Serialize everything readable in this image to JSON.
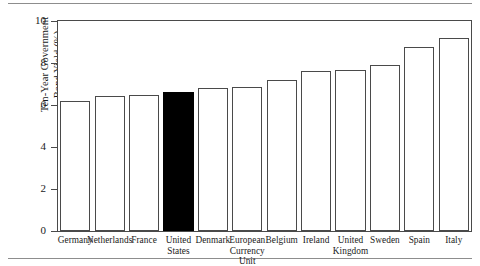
{
  "figure": {
    "rules": [
      "top-rule",
      "bottom-rule"
    ]
  },
  "chart_data": {
    "type": "bar",
    "title": "",
    "xlabel": "",
    "ylabel": "Ten-Year Government Bond Yield (%)",
    "ylabel_lines": [
      "Ten-Year Government",
      "Bond Yield (%)"
    ],
    "ylim": [
      0,
      10
    ],
    "yticks": [
      0,
      2,
      4,
      6,
      8,
      10
    ],
    "ytick_labels": [
      "0",
      "2",
      "4",
      "6",
      "8",
      "10"
    ],
    "grid": false,
    "legend": null,
    "categories": [
      "Germany",
      "Netherlands",
      "France",
      "United States",
      "Denmark",
      "European Currency Unit",
      "Belgium",
      "Ireland",
      "United Kingdom",
      "Sweden",
      "Spain",
      "Italy"
    ],
    "category_label_lines": [
      [
        "Germany"
      ],
      [
        "Netherlands"
      ],
      [
        "France"
      ],
      [
        "United",
        "States"
      ],
      [
        "Denmark"
      ],
      [
        "European",
        "Currency",
        "Unit"
      ],
      [
        "Belgium"
      ],
      [
        "Ireland"
      ],
      [
        "United",
        "Kingdom"
      ],
      [
        "Sweden"
      ],
      [
        "Spain"
      ],
      [
        "Italy"
      ]
    ],
    "values": [
      6.2,
      6.45,
      6.5,
      6.6,
      6.8,
      6.85,
      7.2,
      7.6,
      7.65,
      7.9,
      8.75,
      9.2
    ],
    "highlighted_category": "United States",
    "bar_fill_default": "#ffffff",
    "bar_fill_highlight": "#000000",
    "bar_edge_color": "#4a4a4a",
    "axis_color": "#4a4a4a"
  }
}
